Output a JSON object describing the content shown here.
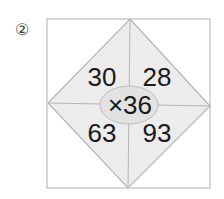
{
  "problem_label": "②",
  "diagram": {
    "center_operation": "×36",
    "operator": "×",
    "multiplier": 36,
    "cells": {
      "top_left": "30",
      "top_right": "28",
      "bottom_left": "63",
      "bottom_right": "93"
    }
  },
  "colors": {
    "square_stroke": "#bdbdbd",
    "diamond_fill": "#ececec",
    "ellipse_fill": "#e2e2e2",
    "text": "#1a1a1a"
  }
}
